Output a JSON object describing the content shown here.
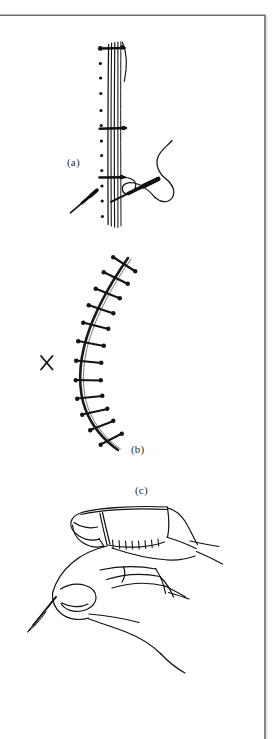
{
  "figure": {
    "kind": "surgical-illustration",
    "background_color": "#ffffff",
    "ink_color": "#1a1a1a",
    "frame_color": "#6a6a6a",
    "width": 277,
    "height": 739,
    "panels": [
      {
        "id": "a",
        "label": "(a)",
        "caption_text": "(a)",
        "subject": "interrupted suture placement across a wound edge with curved needle and thread"
      },
      {
        "id": "b",
        "label": "(b)",
        "caption_text": "(b)",
        "subject": "curved wound closed with a row of interrupted sutures, marked with an X"
      },
      {
        "id": "c",
        "label": "(c)",
        "caption_text": "(c)",
        "subject": "hand holding a sutured fingertip / digital stump"
      }
    ],
    "marks": {
      "x_mark": "×"
    },
    "frame": {
      "top_line": true,
      "right_line": true,
      "bottom_line": false,
      "left_line": false
    }
  }
}
